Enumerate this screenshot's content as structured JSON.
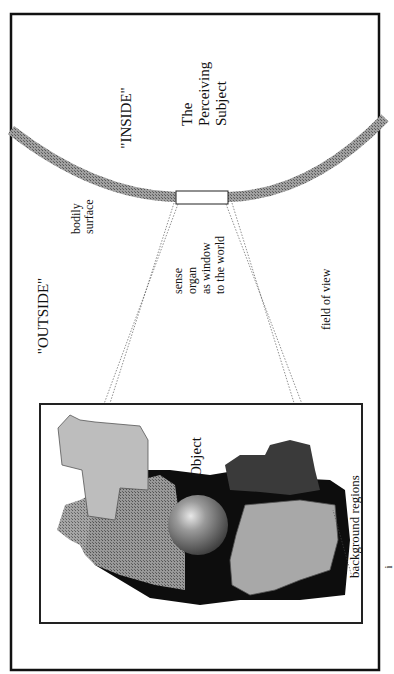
{
  "diagram": {
    "labels": {
      "inside": "\"INSIDE\"",
      "outside": "\"OUTSIDE\"",
      "subject_line1": "The",
      "subject_line2": "Perceiving",
      "subject_line3": "Subject",
      "bodily_line1": "bodily",
      "bodily_line2": "surface",
      "sense_line1": "sense",
      "sense_line2": "organ",
      "sense_line3": "as window",
      "sense_line4": "to the world",
      "field_of_view": "field of view",
      "object": "Object",
      "background_regions": "background regions",
      "page_mark": "i"
    },
    "colors": {
      "frame": "#111111",
      "bodily_surface": "#8a8a8a",
      "light_region": "#b4b4b4",
      "mid_region": "#6e6e6e",
      "dark_region": "#3a3a3a",
      "black_region": "#0d0d0d",
      "sphere_highlight": "#e0e0e0",
      "sphere_shadow": "#3c3c3c"
    },
    "orientation": "rotated 90° counter-clockwise"
  }
}
